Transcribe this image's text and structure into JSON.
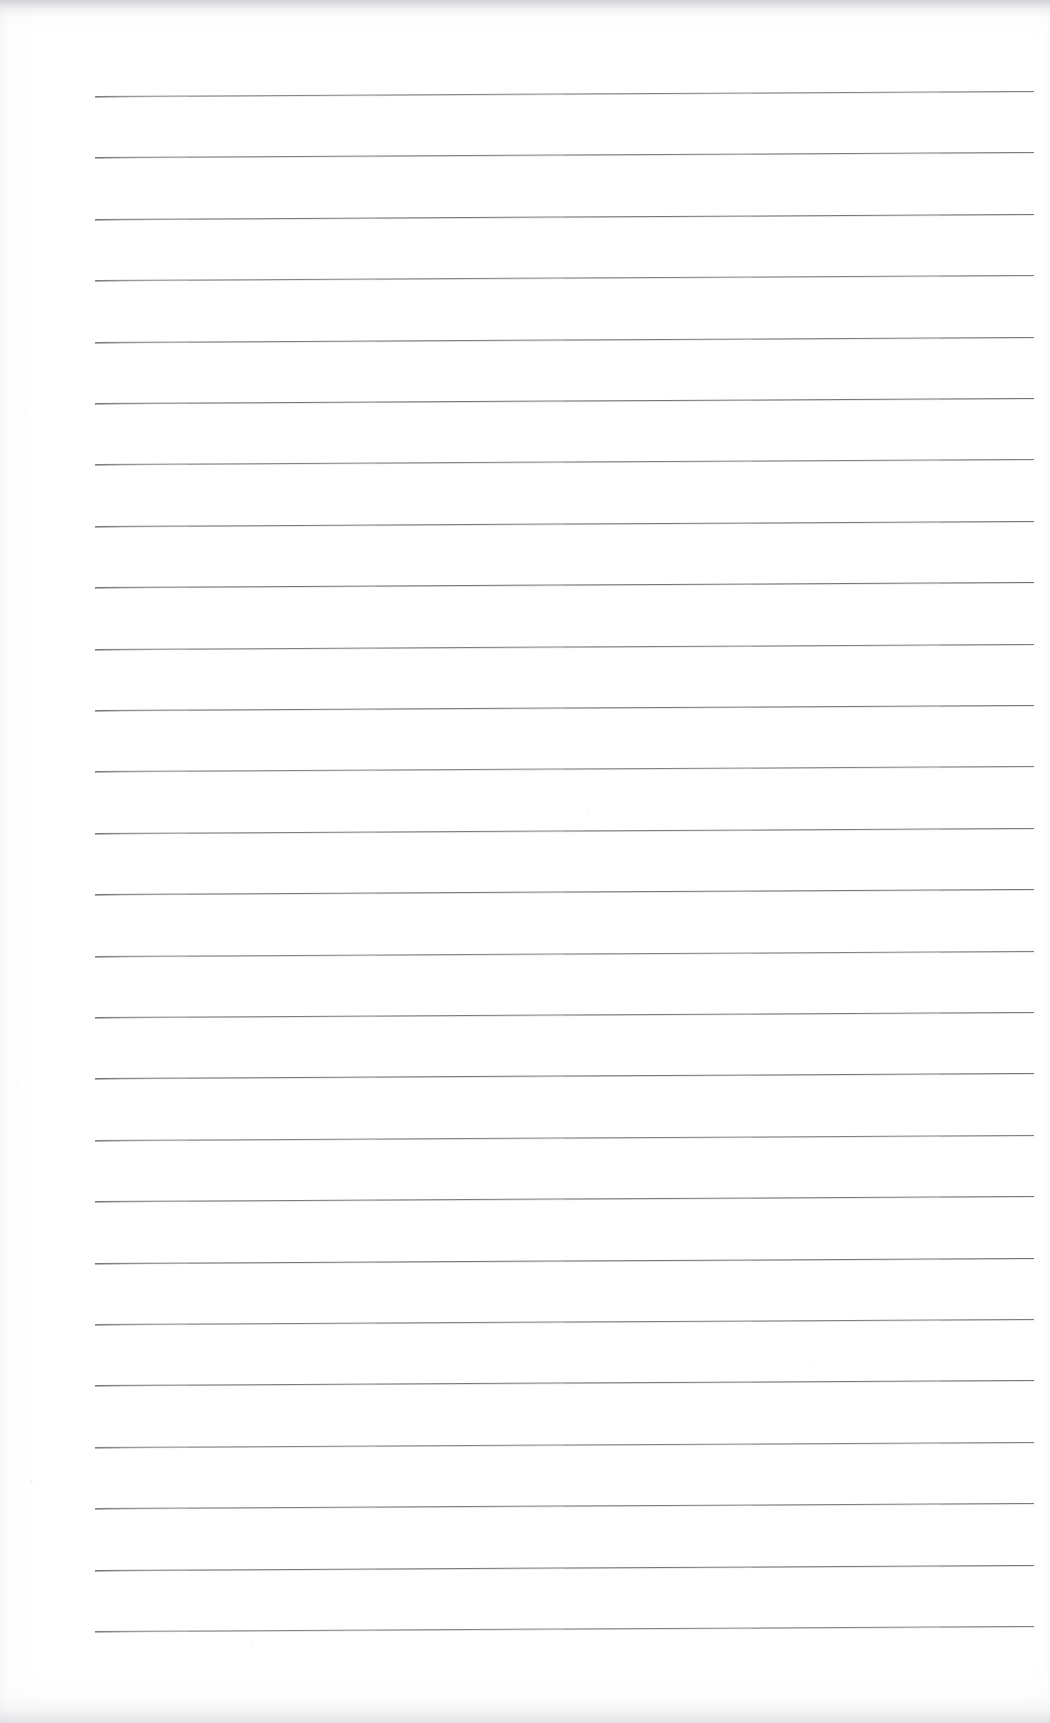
{
  "document": {
    "kind": "scanned-blank-lined-notebook-page",
    "title": "Blank Lined Page",
    "visible_text": "",
    "written_content": "",
    "page_number": "",
    "heading": ""
  },
  "page": {
    "width_px": 1050,
    "height_px": 1723,
    "background_color": "#ffffff",
    "paper_tone": "#fdfdfd",
    "orientation": "portrait"
  },
  "ruling": {
    "line_color": "#6c6e74",
    "line_highlight_color": "#a0a2a8",
    "line_count": 26,
    "left_x": 95,
    "right_x": 1034,
    "line_length_px": 939,
    "first_line_y": 96,
    "line_spacing_px": 61.4,
    "last_line_y": 1631,
    "skew_rise_px": 5,
    "stroke_width_px": 1,
    "line_y_positions": [
      96,
      157.4,
      218.8,
      280.2,
      341.6,
      403.0,
      464.4,
      525.8,
      587.2,
      648.6,
      710.0,
      771.4,
      832.8,
      894.2,
      955.6,
      1017.0,
      1078.4,
      1139.8,
      1201.2,
      1262.6,
      1324.0,
      1385.4,
      1446.8,
      1508.2,
      1569.6,
      1631.0
    ]
  },
  "margins": {
    "top_px": 96,
    "left_px": 95,
    "right_px": 16,
    "bottom_px": 92
  },
  "scan_artifacts": {
    "top_edge_shadow": "#cbcdd0",
    "bottom_edge_shadow": "#dddee1",
    "left_edge_speckle": "#c4c4c8",
    "noise_present": "yes"
  }
}
